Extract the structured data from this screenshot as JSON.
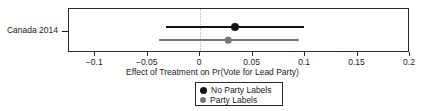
{
  "chart_data": {
    "type": "scatter",
    "subtype": "coefficient-plot-with-confidence-intervals",
    "title": "",
    "xlabel": "Effect of Treatment on Pr(Vote for Lead Party)",
    "ylabel": "",
    "categories": [
      "Canada 2014"
    ],
    "xlim": [
      -0.125,
      0.2
    ],
    "xticks": [
      -0.1,
      -0.05,
      0,
      0.05,
      0.1,
      0.15,
      0.2
    ],
    "xticklabels": [
      "−0.1",
      "−0.05",
      "0",
      "0.05",
      "0.1",
      "0.15",
      "0.2"
    ],
    "grid": false,
    "reference_line": {
      "x": 0,
      "style": "dotted",
      "color": "#b9b9b9"
    },
    "legend_position": "bottom-center",
    "series": [
      {
        "name": "No Party Labels",
        "color": "#141414",
        "marker": "circle",
        "marker_size": 8,
        "points": [
          {
            "category": "Canada 2014",
            "estimate": 0.033,
            "ci_low": -0.033,
            "ci_high": 0.099
          }
        ]
      },
      {
        "name": "Party Labels",
        "color": "#777777",
        "marker": "circle",
        "marker_size": 6.5,
        "points": [
          {
            "category": "Canada 2014",
            "estimate": 0.027,
            "ci_low": -0.039,
            "ci_high": 0.094
          }
        ]
      }
    ]
  },
  "legend": {
    "entries": [
      {
        "label": "No Party Labels",
        "color": "#141414"
      },
      {
        "label": "Party Labels",
        "color": "#777777"
      }
    ]
  },
  "axis": {
    "x_title": "Effect of Treatment on Pr(Vote for Lead Party)",
    "y_category": "Canada 2014"
  }
}
